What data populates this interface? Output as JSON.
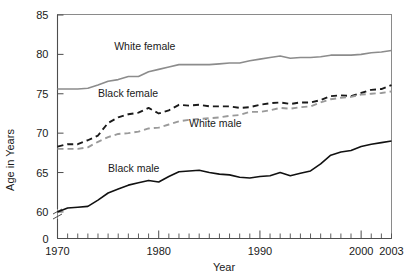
{
  "chart_data": {
    "type": "line",
    "title": "",
    "xlabel": "Year",
    "ylabel": "Age in Years",
    "xlim": [
      1970,
      2003
    ],
    "ylim": [
      59.2,
      85
    ],
    "y_axis_break": true,
    "y_break_label": "0",
    "grid": false,
    "legend": "inline-labels",
    "xticks": [
      1970,
      1980,
      1990,
      2000,
      2003
    ],
    "xtick_labels": [
      "1970",
      "1980",
      "1990",
      "2000",
      "2003"
    ],
    "x_minor_tick_interval": 1,
    "yticks": [
      60,
      65,
      70,
      75,
      80,
      85
    ],
    "ytick_labels": [
      "60",
      "65",
      "70",
      "75",
      "80",
      "85"
    ],
    "x": [
      1970,
      1971,
      1972,
      1973,
      1974,
      1975,
      1976,
      1977,
      1978,
      1979,
      1980,
      1981,
      1982,
      1983,
      1984,
      1985,
      1986,
      1987,
      1988,
      1989,
      1990,
      1991,
      1992,
      1993,
      1994,
      1995,
      1996,
      1997,
      1998,
      1999,
      2000,
      2001,
      2002,
      2003
    ],
    "series": [
      {
        "name": "White female",
        "color": "#8c8c8c",
        "style": "solid",
        "label_x": 1975.6,
        "label_y": 80.6,
        "values": [
          75.6,
          75.6,
          75.6,
          75.7,
          76.1,
          76.6,
          76.8,
          77.2,
          77.2,
          77.8,
          78.1,
          78.4,
          78.7,
          78.7,
          78.7,
          78.7,
          78.8,
          78.9,
          78.9,
          79.2,
          79.4,
          79.6,
          79.8,
          79.5,
          79.6,
          79.6,
          79.7,
          79.9,
          79.9,
          79.9,
          80.0,
          80.2,
          80.3,
          80.5
        ]
      },
      {
        "name": "Black female",
        "color": "#1a1a1a",
        "style": "dashed",
        "label_x": 1974.0,
        "label_y": 74.6,
        "values": [
          68.3,
          68.6,
          68.6,
          69.1,
          69.7,
          71.3,
          72.0,
          72.4,
          72.6,
          73.2,
          72.5,
          72.9,
          73.6,
          73.5,
          73.6,
          73.4,
          73.4,
          73.4,
          73.2,
          73.3,
          73.6,
          73.8,
          73.9,
          73.7,
          73.9,
          73.9,
          74.2,
          74.7,
          74.8,
          74.7,
          75.1,
          75.5,
          75.6,
          76.1
        ]
      },
      {
        "name": "White male",
        "color": "#9a9a9a",
        "style": "dashed",
        "label_x": 1983.0,
        "label_y": 70.8,
        "values": [
          68.0,
          68.0,
          68.0,
          68.2,
          68.9,
          69.5,
          69.9,
          70.0,
          70.2,
          70.6,
          70.7,
          71.1,
          71.5,
          71.7,
          71.8,
          71.9,
          72.0,
          72.2,
          72.3,
          72.7,
          72.7,
          72.9,
          73.2,
          73.1,
          73.3,
          73.4,
          73.9,
          74.3,
          74.5,
          74.6,
          74.9,
          75.0,
          75.1,
          75.3
        ]
      },
      {
        "name": "Black male",
        "color": "#111111",
        "style": "solid",
        "label_x": 1975.0,
        "label_y": 65.1,
        "values": [
          60.0,
          60.5,
          60.6,
          60.7,
          61.5,
          62.4,
          62.9,
          63.4,
          63.7,
          64.0,
          63.8,
          64.5,
          65.1,
          65.2,
          65.3,
          65.0,
          64.8,
          64.7,
          64.4,
          64.3,
          64.5,
          64.6,
          65.0,
          64.6,
          64.9,
          65.2,
          66.1,
          67.2,
          67.6,
          67.8,
          68.3,
          68.6,
          68.8,
          69.0
        ]
      }
    ]
  }
}
